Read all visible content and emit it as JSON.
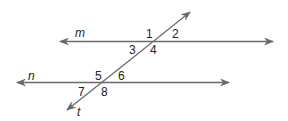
{
  "diagram": {
    "lines": {
      "m": "m",
      "n": "n",
      "t": "t"
    },
    "angles": [
      "1",
      "2",
      "3",
      "4",
      "5",
      "6",
      "7",
      "8"
    ],
    "line_color": "#6a6a6a"
  }
}
